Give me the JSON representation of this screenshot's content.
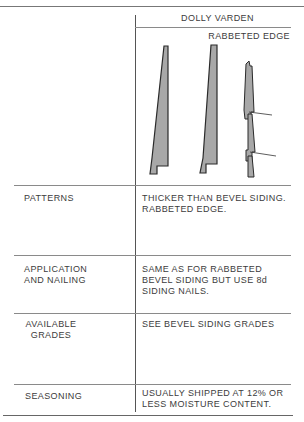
{
  "header": {
    "title": "DOLLY VARDEN",
    "subtitle": "RABBETED EDGE"
  },
  "figure": {
    "fill_color": "#a8a8a8",
    "outline_color": "#2a2a2a"
  },
  "rows": [
    {
      "label_lines": [
        "PATTERNS"
      ],
      "value_lines": [
        "THICKER THAN BEVEL SIDING.",
        "RABBETED EDGE."
      ]
    },
    {
      "label_lines": [
        "APPLICATION",
        "AND NAILING"
      ],
      "value_lines": [
        "SAME AS FOR RABBETED",
        "BEVEL SIDING BUT USE 8d",
        "SIDING NAILS."
      ]
    },
    {
      "label_lines": [
        "AVAILABLE",
        "GRADES"
      ],
      "value_lines": [
        "SEE BEVEL SIDING GRADES"
      ]
    },
    {
      "label_lines": [
        "SEASONING"
      ],
      "value_lines": [
        "USUALLY SHIPPED AT 12% OR",
        "LESS MOISTURE CONTENT."
      ]
    }
  ]
}
